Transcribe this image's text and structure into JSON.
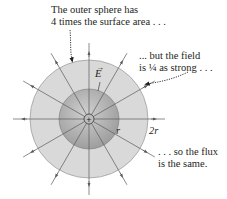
{
  "annotations": {
    "outer_sphere": [
      "The outer sphere has",
      "4 times the surface area . . ."
    ],
    "field": [
      "... but the field",
      "is ¼ as strong . . ."
    ],
    "flux": [
      ". . . so the flux",
      "is the same."
    ]
  },
  "labels": {
    "field_vector": "E",
    "vector_arrow": "→",
    "inner_radius": "r",
    "outer_radius": "2r",
    "charge_symbol": "+"
  },
  "geometry": {
    "center": [
      89,
      119
    ],
    "inner_radius_px": 30,
    "outer_radius_px": 59,
    "field_line_count": 12,
    "field_line_angle_step_deg": 30
  },
  "colors": {
    "outer_sphere": "#d9d9d9",
    "inner_sphere_light": "#cfcfcf",
    "inner_sphere_dark": "#9e9e9e",
    "field_lines": "#5a5a5a",
    "text": "#231f20"
  }
}
